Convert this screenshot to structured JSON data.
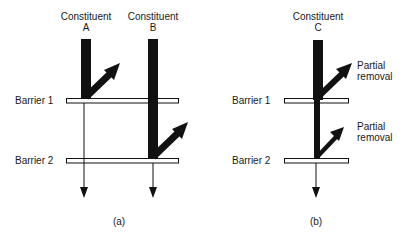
{
  "diagram": {
    "panels": [
      {
        "id": "a",
        "caption": "(a)",
        "constituents": [
          {
            "label_line1": "Constituent",
            "label_line2": "A"
          },
          {
            "label_line1": "Constituent",
            "label_line2": "B"
          }
        ],
        "barriers": [
          "Barrier 1",
          "Barrier 2"
        ]
      },
      {
        "id": "b",
        "caption": "(b)",
        "constituents": [
          {
            "label_line1": "Constituent",
            "label_line2": "C"
          }
        ],
        "barriers": [
          "Barrier 1",
          "Barrier 2"
        ],
        "annotations": [
          {
            "line1": "Partial",
            "line2": "removal"
          },
          {
            "line1": "Partial",
            "line2": "removal"
          }
        ]
      }
    ],
    "colors": {
      "ink": "#111111",
      "background": "#ffffff"
    }
  }
}
